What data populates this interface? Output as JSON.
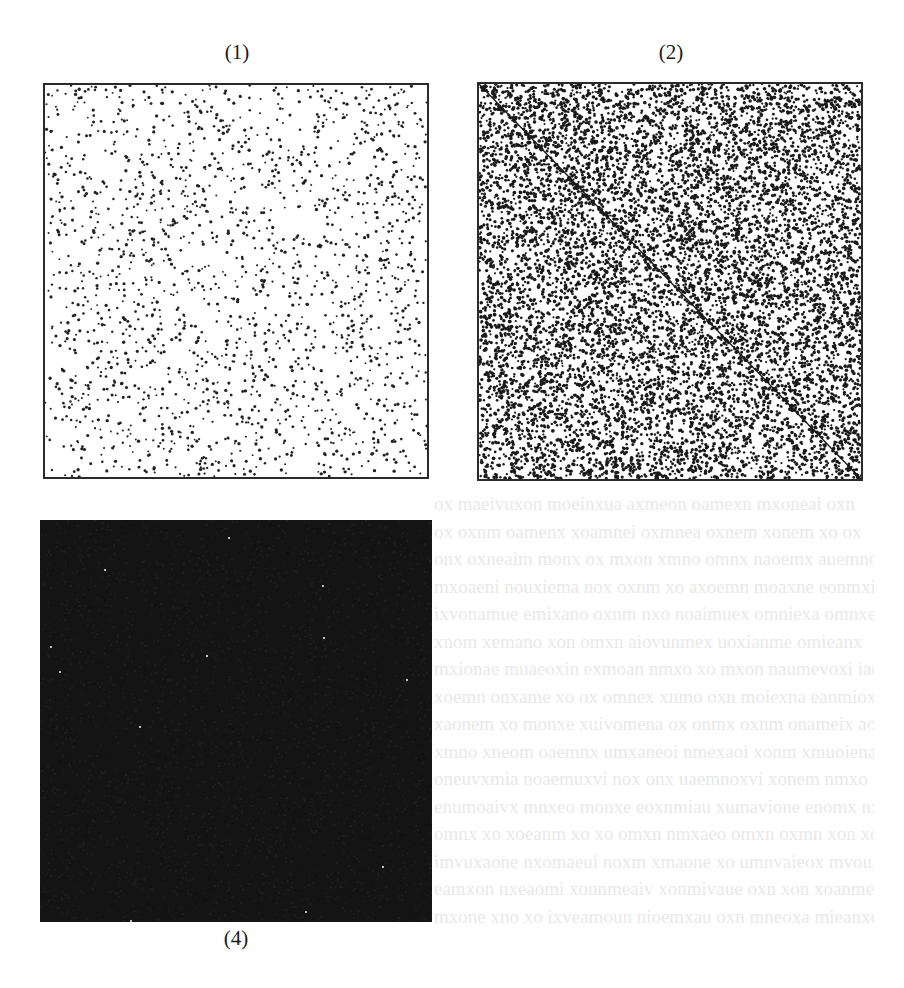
{
  "figure": {
    "panels": [
      {
        "id": "1",
        "label": "(1)",
        "style": "sparse-dots",
        "background": "#ffffff",
        "dot_color": "#222222",
        "dot_count": 1900,
        "dot_radius": 1.3,
        "diagonal": false,
        "seed": 11
      },
      {
        "id": "2",
        "label": "(2)",
        "style": "dense-dots-with-diagonal",
        "background": "#ffffff",
        "dot_color": "#1a1a1a",
        "dot_count": 9500,
        "dot_radius": 1.45,
        "diagonal": true,
        "diagonal_color": "#1a1a1a",
        "seed": 23
      },
      {
        "id": "4",
        "label": "(4)",
        "style": "near-black-fill",
        "background": "#141414",
        "speck_color": "#bdbdbd",
        "speck_count": 12,
        "seed": 41
      }
    ]
  },
  "page": {
    "background": "#ffffff",
    "bleed_through_lines": 16
  }
}
